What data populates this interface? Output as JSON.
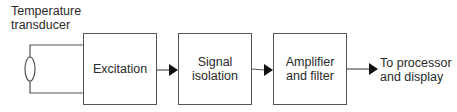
{
  "diagram": {
    "type": "block-diagram",
    "sensor": {
      "label": "Temperature\ntransducer",
      "icon": "transducer-ellipse-icon"
    },
    "blocks": [
      {
        "id": "excitation",
        "label": "Excitation"
      },
      {
        "id": "signal-isolation",
        "label": "Signal\nisolation"
      },
      {
        "id": "amplifier-filter",
        "label": "Amplifier\nand filter"
      }
    ],
    "output": {
      "label": "To processor\nand display"
    },
    "connections": [
      {
        "from": "sensor",
        "to": "excitation"
      },
      {
        "from": "excitation",
        "to": "signal-isolation"
      },
      {
        "from": "signal-isolation",
        "to": "amplifier-filter"
      },
      {
        "from": "amplifier-filter",
        "to": "output"
      }
    ],
    "colors": {
      "line": "#555555",
      "text": "#2a2a2a",
      "background": "#ffffff"
    }
  }
}
